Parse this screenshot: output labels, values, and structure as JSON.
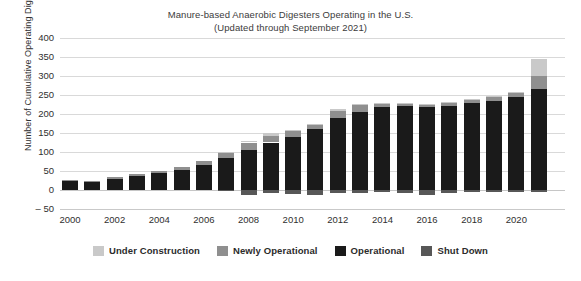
{
  "chart_data": {
    "type": "bar",
    "title": "Manure-based Anaerobic Digesters Operating in the U.S.",
    "subtitle": "(Updated through September 2021)",
    "xlabel": "",
    "ylabel": "Number of Cumulative Operating Digesters",
    "ylim": [
      -50,
      400
    ],
    "ytick_step": 50,
    "yticks": [
      "400",
      "350",
      "300",
      "250",
      "200",
      "150",
      "100",
      "50",
      "0",
      "– 50"
    ],
    "grid": true,
    "stacked": true,
    "legend_position": "bottom",
    "categories": [
      "2000",
      "2001",
      "2002",
      "2003",
      "2004",
      "2005",
      "2006",
      "2007",
      "2008",
      "2009",
      "2010",
      "2011",
      "2012",
      "2013",
      "2014",
      "2015",
      "2016",
      "2017",
      "2018",
      "2019",
      "2020",
      "2021"
    ],
    "xtick_labels": [
      "2000",
      "2002",
      "2004",
      "2006",
      "2008",
      "2010",
      "2012",
      "2014",
      "2016",
      "2018",
      "2020"
    ],
    "series": [
      {
        "name": "Operational",
        "color": "#1a1a1a",
        "values": [
          25,
          22,
          30,
          37,
          45,
          53,
          67,
          85,
          105,
          125,
          140,
          160,
          190,
          205,
          218,
          222,
          218,
          222,
          228,
          235,
          245,
          265
        ]
      },
      {
        "name": "Newly Operational",
        "color": "#8f8f8f",
        "values": [
          2,
          3,
          4,
          5,
          6,
          7,
          10,
          13,
          20,
          18,
          14,
          12,
          18,
          18,
          9,
          6,
          6,
          7,
          9,
          10,
          10,
          35
        ]
      },
      {
        "name": "Under Construction",
        "color": "#c9c9c9",
        "values": [
          0,
          0,
          0,
          0,
          0,
          0,
          0,
          2,
          5,
          6,
          4,
          3,
          4,
          4,
          3,
          2,
          2,
          2,
          2,
          3,
          3,
          45
        ]
      },
      {
        "name": "Shut Down",
        "color": "#575757",
        "values": [
          0,
          0,
          0,
          0,
          0,
          0,
          0,
          -3,
          -14,
          -9,
          -11,
          -13,
          -7,
          -7,
          -5,
          -7,
          -13,
          -7,
          -6,
          -5,
          -4,
          -4
        ]
      }
    ]
  },
  "legend": {
    "items": [
      {
        "label": "Under Construction",
        "color": "#c9c9c9"
      },
      {
        "label": "Newly Operational",
        "color": "#8f8f8f"
      },
      {
        "label": "Operational",
        "color": "#1a1a1a"
      },
      {
        "label": "Shut Down",
        "color": "#575757"
      }
    ]
  }
}
